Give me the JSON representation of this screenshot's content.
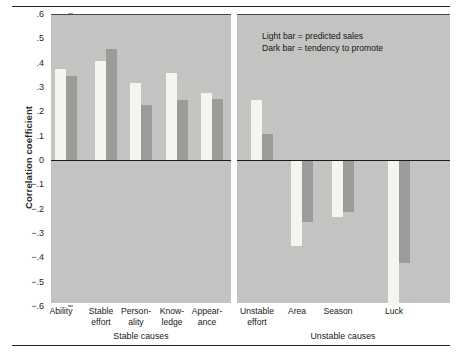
{
  "chart_data": {
    "type": "bar",
    "title": "",
    "xlabel": "",
    "ylabel": "Correlation coefficient",
    "ylim": [
      -0.6,
      0.6
    ],
    "ytick_labels": [
      ".6",
      ".5",
      ".4",
      ".3",
      ".2",
      ".1",
      "0",
      "−.1",
      "−.2",
      "−.3",
      "−.4",
      "−.5",
      "−.6"
    ],
    "ytick_values": [
      0.6,
      0.5,
      0.4,
      0.3,
      0.2,
      0.1,
      0,
      -0.1,
      -0.2,
      -0.3,
      -0.4,
      -0.5,
      -0.6
    ],
    "grid": false,
    "legend_position": "upper right inside plot",
    "legend": [
      "Light bar = predicted sales",
      "Dark bar = tendency to promote"
    ],
    "series": [
      {
        "name": "predicted sales",
        "style": "light",
        "color": "#f4f4f1",
        "values": [
          0.38,
          0.41,
          0.32,
          0.36,
          0.28,
          0.25,
          -0.35,
          -0.23,
          -0.59
        ]
      },
      {
        "name": "tendency to promote",
        "style": "dark",
        "color": "#9b9b99",
        "values": [
          0.35,
          0.46,
          0.23,
          0.25,
          0.255,
          0.11,
          -0.25,
          -0.21,
          -0.42
        ]
      }
    ],
    "categories": [
      "Ability",
      "Stable\neffort",
      "Person-\nality",
      "Know-\nledge",
      "Appear-\nance",
      "Unstable\neffort",
      "Area",
      "Season",
      "Luck"
    ],
    "groups": [
      {
        "label": "Stable causes",
        "categories": [
          "Ability",
          "Stable effort",
          "Person-ality",
          "Know-ledge",
          "Appear-ance"
        ]
      },
      {
        "label": "Unstable causes",
        "categories": [
          "Unstable effort",
          "Area",
          "Season",
          "Luck"
        ]
      }
    ],
    "colors": {
      "plot_background": "#c3c3c1",
      "light_bar": "#f4f4f1",
      "dark_bar": "#9b9b99",
      "axis": "#1c1c1b",
      "page_background": "#ffffff"
    }
  },
  "axis": {
    "y_label": "Correlation coefficient",
    "ticks": [
      ".6",
      ".5",
      ".4",
      ".3",
      ".2",
      ".1",
      "0",
      "−.1",
      "−.2",
      "−.3",
      "−.4",
      "−.5",
      "−.6"
    ]
  },
  "legend": {
    "line1": "Light bar = predicted sales",
    "line2": "Dark bar = tendency to promote"
  },
  "categories": [
    {
      "line1": "Ability",
      "line2": ""
    },
    {
      "line1": "Stable",
      "line2": "effort"
    },
    {
      "line1": "Person-",
      "line2": "ality"
    },
    {
      "line1": "Know-",
      "line2": "ledge"
    },
    {
      "line1": "Appear-",
      "line2": "ance"
    },
    {
      "line1": "Unstable",
      "line2": "effort"
    },
    {
      "line1": "Area",
      "line2": ""
    },
    {
      "line1": "Season",
      "line2": ""
    },
    {
      "line1": "Luck",
      "line2": ""
    }
  ],
  "groups": {
    "left": "Stable causes",
    "right": "Unstable causes"
  }
}
